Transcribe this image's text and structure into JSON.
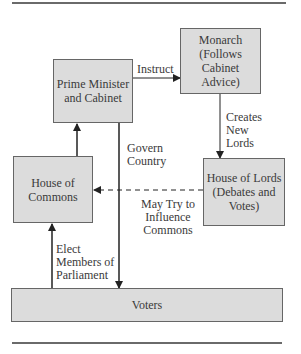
{
  "diagram": {
    "nodes": {
      "prime_minister": "Prime Minister and Cabinet",
      "monarch": "Monarch (Follows Cabinet Advice)",
      "house_of_lords": "House of Lords (Debates and Votes)",
      "house_of_commons": "House of Commons",
      "voters": "Voters"
    },
    "edges": {
      "instruct": "Instruct",
      "creates_new_lords": [
        "Creates",
        "New",
        "Lords"
      ],
      "govern_country": [
        "Govern",
        "Country"
      ],
      "may_try_to_influence": [
        "May Try to",
        "Influence",
        "Commons"
      ],
      "elect_members": [
        "Elect",
        "Members of",
        "Parliament"
      ]
    },
    "colors": {
      "box_fill": "#dcdcdc",
      "box_border": "#666666",
      "line": "#222222"
    }
  }
}
